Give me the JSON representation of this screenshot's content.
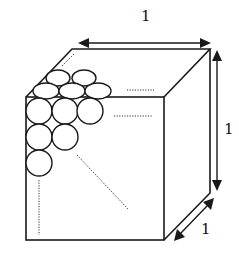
{
  "diagram": {
    "dimension_labels": {
      "width": "1",
      "height": "1",
      "depth": "1"
    },
    "colors": {
      "line": "#1a1a1a",
      "background": "#ffffff"
    },
    "spheres_visible": {
      "top_back_row": 2,
      "top_middle_row": 3,
      "front_row_1": 3,
      "front_row_2": 2,
      "front_row_3": 1
    }
  }
}
